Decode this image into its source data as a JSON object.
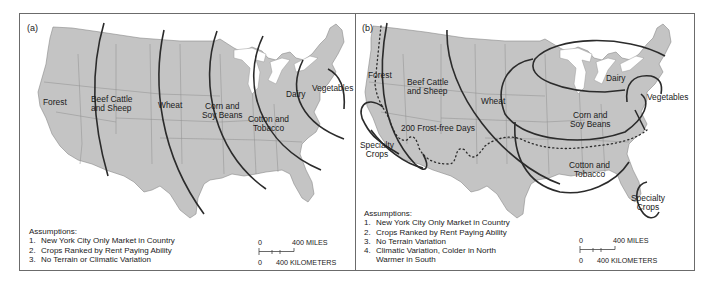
{
  "figure": {
    "background_color": "#ffffff",
    "land_color": "#c4c4c4",
    "border_color": "#6b6b6b",
    "zone_line_color": "#2b2b2b"
  },
  "panels": [
    {
      "id": "a",
      "label": "(a)",
      "regions": [
        {
          "name": "forest",
          "text": [
            "Forest"
          ]
        },
        {
          "name": "beef-cattle-and-sheep",
          "text": [
            "Beef Cattle",
            "and Sheep"
          ]
        },
        {
          "name": "wheat",
          "text": [
            "Wheat"
          ]
        },
        {
          "name": "corn-and-soy-beans",
          "text": [
            "Corn and",
            "Soy Beans"
          ]
        },
        {
          "name": "cotton-and-tobacco",
          "text": [
            "Cotton and",
            "Tobacco"
          ]
        },
        {
          "name": "dairy",
          "text": [
            "Dairy"
          ]
        },
        {
          "name": "vegetables",
          "text": [
            "Vegetables"
          ]
        }
      ],
      "assumptions": {
        "title": "Assumptions:",
        "items": [
          {
            "num": "1.",
            "text": "New York City Only Market in Country"
          },
          {
            "num": "2.",
            "text": "Crops Ranked by Rent Paying Ability"
          },
          {
            "num": "3.",
            "text": "No Terrain or Climatic Variation"
          }
        ]
      },
      "scale": {
        "miles_zero": "0",
        "miles_label": "400 MILES",
        "km_zero": "0",
        "km_label": "400 KILOMETERS"
      }
    },
    {
      "id": "b",
      "label": "(b)",
      "regions": [
        {
          "name": "forest",
          "text": [
            "Forest"
          ]
        },
        {
          "name": "beef-cattle-and-sheep",
          "text": [
            "Beef Cattle",
            "and Sheep"
          ]
        },
        {
          "name": "wheat",
          "text": [
            "Wheat"
          ]
        },
        {
          "name": "frost-free-line",
          "text": [
            "200 Frost-free Days"
          ]
        },
        {
          "name": "specialty-crops-west",
          "text": [
            "Specialty",
            "Crops"
          ]
        },
        {
          "name": "dairy",
          "text": [
            "Dairy"
          ]
        },
        {
          "name": "vegetables",
          "text": [
            "Vegetables"
          ]
        },
        {
          "name": "corn-and-soy-beans",
          "text": [
            "Corn and",
            "Soy Beans"
          ]
        },
        {
          "name": "cotton-and-tobacco",
          "text": [
            "Cotton and",
            "Tobacco"
          ]
        },
        {
          "name": "specialty-crops-florida",
          "text": [
            "Specialty",
            "Crops"
          ]
        }
      ],
      "assumptions": {
        "title": "Assumptions:",
        "items": [
          {
            "num": "1.",
            "text": "New York City Only Market in Country"
          },
          {
            "num": "2.",
            "text": "Crops Ranked by Rent Paying Ability"
          },
          {
            "num": "3.",
            "text": "No Terrain Variation"
          },
          {
            "num": "4.",
            "text": "Climatic Variation, Colder in North",
            "cont": "Warmer in South"
          }
        ]
      },
      "scale": {
        "miles_zero": "0",
        "miles_label": "400 MILES",
        "km_zero": "0",
        "km_label": "400 KILOMETERS"
      }
    }
  ]
}
